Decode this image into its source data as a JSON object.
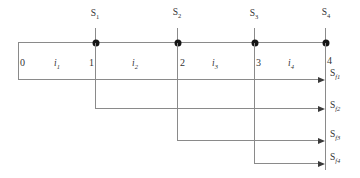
{
  "diagram": {
    "top_labels": [
      {
        "base": "S",
        "sub": "1"
      },
      {
        "base": "S",
        "sub": "2"
      },
      {
        "base": "S",
        "sub": "3"
      },
      {
        "base": "S",
        "sub": "4"
      }
    ],
    "time_labels": [
      "0",
      "1",
      "2",
      "3",
      "4"
    ],
    "interval_labels": [
      {
        "base": "i",
        "sub": "1"
      },
      {
        "base": "i",
        "sub": "2"
      },
      {
        "base": "i",
        "sub": "3"
      },
      {
        "base": "i",
        "sub": "4"
      }
    ],
    "future_labels": [
      {
        "base": "S",
        "sub": "f1"
      },
      {
        "base": "S",
        "sub": "f2"
      },
      {
        "base": "S",
        "sub": "f3"
      },
      {
        "base": "S",
        "sub": "f4"
      }
    ],
    "colors": {
      "line": "#8a8a8a",
      "dot": "#151515",
      "arrow": "#3a3a3a",
      "text": "#333333",
      "background": "#ffffff"
    }
  }
}
